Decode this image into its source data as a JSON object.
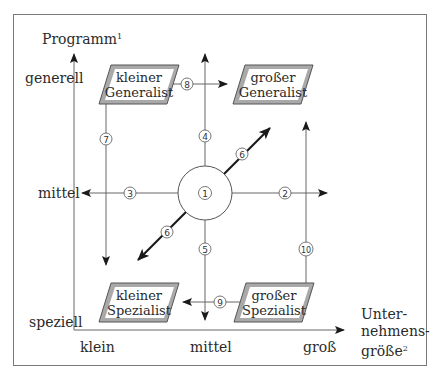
{
  "axes": {
    "y_title": "Programm",
    "y_title_sup": "1",
    "y_ticks": [
      "generell",
      "mittel",
      "speziell"
    ],
    "x_title_lines": [
      "Unter-",
      "nehmens-",
      "größe"
    ],
    "x_title_sup": "2",
    "x_ticks": [
      "klein",
      "mittel",
      "groß"
    ]
  },
  "boxes": {
    "top_left": [
      "kleiner",
      "Generalist"
    ],
    "top_right": [
      "großer",
      "Generalist"
    ],
    "bottom_left": [
      "kleiner",
      "Spezialist"
    ],
    "bottom_right": [
      "großer",
      "Spezialist"
    ]
  },
  "markers": {
    "m1": "①",
    "m2": "②",
    "m3": "③",
    "m4": "④",
    "m5": "⑤",
    "m6a": "⑥",
    "m6b": "⑥",
    "m7": "⑦",
    "m8": "⑧",
    "m9": "⑨",
    "m10": "⑩"
  },
  "colors": {
    "line": "#555555",
    "box_fill": "#a9a9a9",
    "box_inner": "#ffffff",
    "frame": "#7a7a7a"
  }
}
